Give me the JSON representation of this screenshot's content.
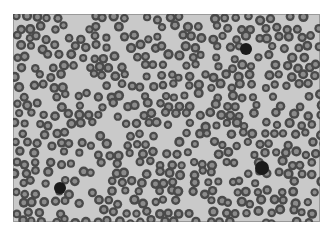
{
  "image": {
    "subject": "blood smear micrograph",
    "description": "Grayscale microscopy image of densely packed red blood cells with a few dark white blood cells",
    "colors": {
      "background": "#c9c9c9",
      "cell_rim": "#4a4a4a",
      "cell_center": "#8c8c8c",
      "dark_cell": "#1a1a1a"
    }
  }
}
